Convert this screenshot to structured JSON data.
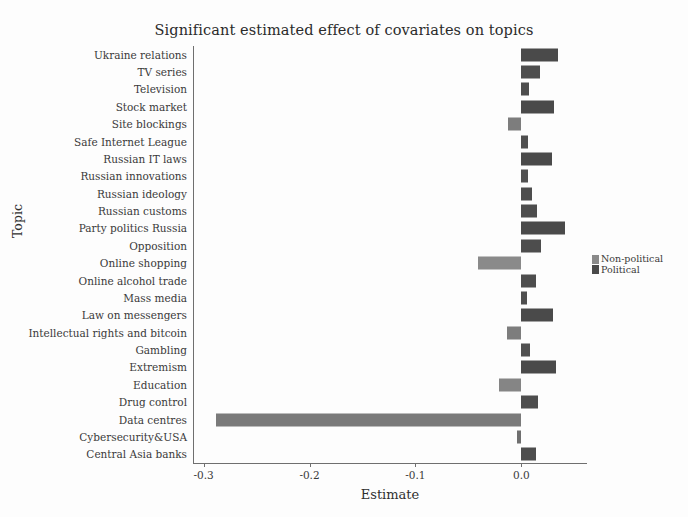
{
  "chart_data": {
    "type": "bar",
    "orientation": "horizontal",
    "title": "Significant estimated effect of covariates on topics",
    "xlabel": "Estimate",
    "ylabel": "Topic",
    "xlim": [
      -0.31,
      0.062
    ],
    "xticks": [
      -0.3,
      -0.2,
      -0.1,
      0.0
    ],
    "xticklabels": [
      "-0.3",
      "-0.2",
      "-0.1",
      "0.0"
    ],
    "grid": false,
    "legend_position": "right",
    "legend": [
      {
        "label": "Non-political",
        "color": "#8a8a8a"
      },
      {
        "label": "Political",
        "color": "#4a4a4a"
      }
    ],
    "categories": [
      "Ukraine relations",
      "TV series",
      "Television",
      "Stock market",
      "Site blockings",
      "Safe Internet League",
      "Russian IT laws",
      "Russian innovations",
      "Russian ideology",
      "Russian customs",
      "Party politics Russia",
      "Opposition",
      "Online shopping",
      "Online alcohol trade",
      "Mass media",
      "Law on messengers",
      "Intellectual rights and bitcoin",
      "Gambling",
      "Extremism",
      "Education",
      "Drug control",
      "Data centres",
      "Cybersecurity&USA",
      "Central Asia banks"
    ],
    "values": [
      0.0345,
      0.018,
      0.0075,
      0.031,
      -0.0125,
      0.006,
      0.0285,
      0.006,
      0.0105,
      0.015,
      0.041,
      0.0185,
      -0.041,
      0.014,
      0.0055,
      0.03,
      -0.014,
      0.0085,
      0.033,
      -0.021,
      0.0155,
      -0.288,
      -0.0045,
      0.0135
    ],
    "groups": [
      "Political",
      "Non-political",
      "Non-political",
      "Non-political",
      "Political",
      "Political",
      "Political",
      "Non-political",
      "Political",
      "Non-political",
      "Political",
      "Political",
      "Non-political",
      "Political",
      "Political",
      "Political",
      "Political",
      "Non-political",
      "Political",
      "Non-political",
      "Political",
      "Non-political",
      "Political",
      "Non-political"
    ],
    "colors": [
      "#4a4a4a",
      "#4d4d4d",
      "#4d4d4d",
      "#4a4a4a",
      "#7d7d7d",
      "#4f4f4f",
      "#4a4a4a",
      "#515151",
      "#4d4d4d",
      "#4d4d4d",
      "#4a4a4a",
      "#4d4d4d",
      "#8a8a8a",
      "#4d4d4d",
      "#4f4f4f",
      "#4a4a4a",
      "#7d7d7d",
      "#4f4f4f",
      "#4a4a4a",
      "#858585",
      "#4d4d4d",
      "#7a7a7a",
      "#6f6f6f",
      "#4d4d4d"
    ]
  }
}
